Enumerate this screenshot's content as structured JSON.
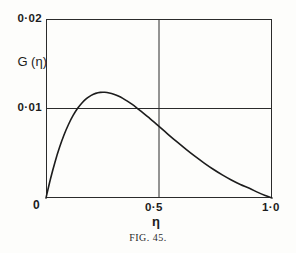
{
  "figure": {
    "caption": "FIG. 45.",
    "background_color": "#fdfdfb",
    "ink_color": "#1c1c1c"
  },
  "axes": {
    "y_axis_title": "G (η)",
    "y_tick_top": "0·02",
    "y_tick_mid": "0·01",
    "y_tick_origin": "0",
    "x_axis_title": "η",
    "x_tick_mid": "0·5",
    "x_tick_right": "1·0"
  },
  "chart_data": {
    "type": "line",
    "title": "",
    "subtitle": "",
    "xlabel": "η",
    "ylabel": "G (η)",
    "xlim": [
      0,
      1.0
    ],
    "ylim": [
      0,
      0.02
    ],
    "grid": true,
    "gridlines_x": [
      0.5
    ],
    "gridlines_y": [
      0.01
    ],
    "xticks": [
      0,
      0.5,
      1.0
    ],
    "xticklabels": [
      "0",
      "0·5",
      "1·0"
    ],
    "yticks": [
      0,
      0.01,
      0.02
    ],
    "yticklabels": [
      "0",
      "0·01",
      "0·02"
    ],
    "legend": null,
    "annotations": [],
    "series": [
      {
        "name": "G(η)",
        "color": "#1c1c1c",
        "line_width": 1.6,
        "peak": {
          "x": 0.26,
          "y": 0.0175
        },
        "crossings_y_0p01": [
          0.105,
          0.5
        ],
        "x": [
          0.0,
          0.02,
          0.04,
          0.06,
          0.08,
          0.1,
          0.12,
          0.14,
          0.16,
          0.18,
          0.2,
          0.22,
          0.24,
          0.26,
          0.28,
          0.3,
          0.32,
          0.34,
          0.36,
          0.38,
          0.4,
          0.42,
          0.44,
          0.46,
          0.48,
          0.5,
          0.54,
          0.58,
          0.62,
          0.66,
          0.7,
          0.74,
          0.78,
          0.82,
          0.86,
          0.9,
          0.94,
          0.97,
          1.0
        ],
        "values": [
          0.0,
          0.00215,
          0.00403,
          0.00566,
          0.00706,
          0.00824,
          0.00922,
          0.01002,
          0.01065,
          0.01113,
          0.01147,
          0.01169,
          0.0118,
          0.01181,
          0.01174,
          0.0116,
          0.01139,
          0.01113,
          0.01082,
          0.01048,
          0.01011,
          0.00971,
          0.0093,
          0.00887,
          0.00844,
          0.008,
          0.00712,
          0.00626,
          0.00543,
          0.00464,
          0.0039,
          0.00321,
          0.00258,
          0.00201,
          0.00151,
          0.00108,
          0.0006,
          0.00028,
          0.0
        ]
      }
    ]
  }
}
